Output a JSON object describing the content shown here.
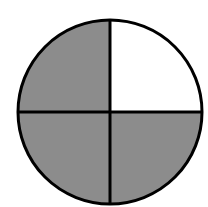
{
  "diagram": {
    "type": "fraction-circle",
    "parts_total": 4,
    "parts_shaded": 3,
    "fraction_shaded": "3/4",
    "quadrants": [
      {
        "position": "top-left",
        "shaded": true
      },
      {
        "position": "top-right",
        "shaded": false
      },
      {
        "position": "bottom-left",
        "shaded": true
      },
      {
        "position": "bottom-right",
        "shaded": true
      }
    ],
    "colors": {
      "shaded": "#8c8c8c",
      "unshaded": "#ffffff",
      "stroke": "#000000",
      "background": "#ffffff"
    }
  }
}
